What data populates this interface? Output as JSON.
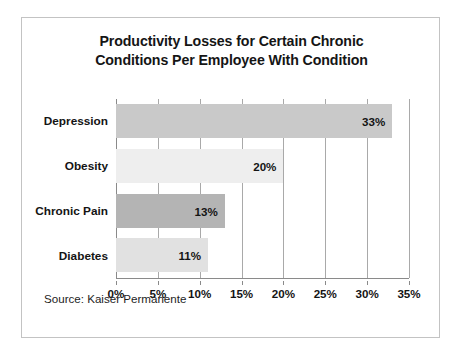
{
  "figure": {
    "title_line_1": "Productivity Losses for Certain Chronic",
    "title_line_2": "Conditions Per Employee With Condition",
    "source_note": "Source: Kaiser Permanente",
    "border_color": "#c3c3c3",
    "background_color": "#ffffff"
  },
  "chart_data": {
    "type": "bar",
    "orientation": "horizontal",
    "title": "Productivity Losses for Certain Chronic Conditions Per Employee With Condition",
    "xlabel": "",
    "ylabel": "",
    "xlim": [
      0,
      35
    ],
    "grid": true,
    "legend": "none",
    "categories": [
      "Depression",
      "Obesity",
      "Chronic Pain",
      "Diabetes"
    ],
    "values": [
      33,
      20,
      13,
      11
    ],
    "value_labels": [
      "33%",
      "20%",
      "13%",
      "11%"
    ],
    "bar_colors": [
      "#c9c9c9",
      "#eeeeee",
      "#b4b4b4",
      "#e1e1e1"
    ],
    "tick_values": [
      0,
      5,
      10,
      15,
      20,
      25,
      30,
      35
    ],
    "tick_labels": [
      "0%",
      "5%",
      "10%",
      "15%",
      "20%",
      "25%",
      "30%",
      "35%"
    ],
    "grid_color": "#a9a9a9",
    "axis_color": "#8a8a8a"
  }
}
